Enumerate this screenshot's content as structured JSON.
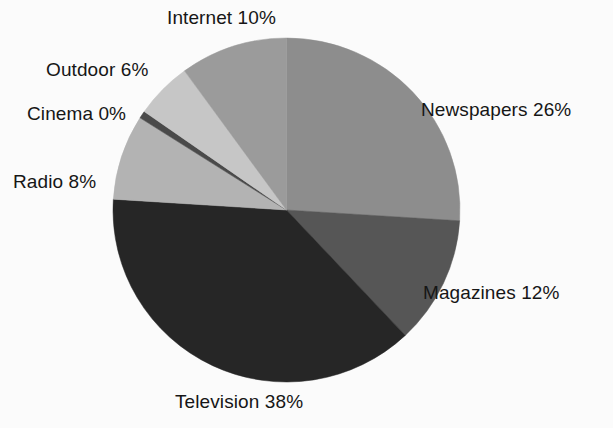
{
  "chart_data": {
    "type": "pie",
    "title": "",
    "subtitle": "",
    "xlabel": "",
    "ylabel": "",
    "legend_position": "none",
    "grid": false,
    "unit": "%",
    "start_angle_deg": 0,
    "direction": "clockwise",
    "categories": [
      "Newspapers",
      "Magazines",
      "Television",
      "Radio",
      "Cinema",
      "Outdoor",
      "Internet"
    ],
    "values": [
      26,
      12,
      38,
      8,
      0,
      6,
      10
    ],
    "slices": [
      {
        "label": "Newspapers",
        "value": 26,
        "value_text": "26%",
        "text": "Newspapers 26%",
        "color": "#8d8d8d",
        "start_pct": 0,
        "end_pct": 26
      },
      {
        "label": "Magazines",
        "value": 12,
        "value_text": "12%",
        "text": "Magazines 12%",
        "color": "#565656",
        "start_pct": 26,
        "end_pct": 38
      },
      {
        "label": "Television",
        "value": 38,
        "value_text": "38%",
        "text": "Television 38%",
        "color": "#262626",
        "start_pct": 38,
        "end_pct": 76
      },
      {
        "label": "Radio",
        "value": 8,
        "value_text": "8%",
        "text": "Radio 8%",
        "color": "#b3b3b3",
        "start_pct": 76,
        "end_pct": 84
      },
      {
        "label": "Cinema",
        "value": 0,
        "value_text": "0%",
        "text": "Cinema 0%",
        "color": "#4a4a4a",
        "start_pct": 84,
        "end_pct": 84.7
      },
      {
        "label": "Outdoor",
        "value": 6,
        "value_text": "6%",
        "text": "Outdoor 6%",
        "color": "#c6c6c6",
        "start_pct": 84.7,
        "end_pct": 90
      },
      {
        "label": "Internet",
        "value": 10,
        "value_text": "10%",
        "text": "Internet 10%",
        "color": "#9b9b9b",
        "start_pct": 90,
        "end_pct": 100
      }
    ],
    "background_color": "#fbfbfb",
    "text_color": "#161616"
  }
}
